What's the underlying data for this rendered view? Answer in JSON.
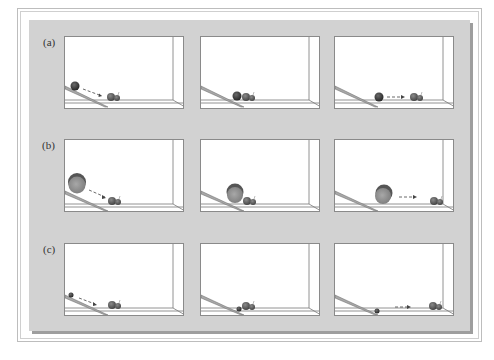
{
  "figure": {
    "rows": [
      {
        "label": "(a)",
        "ball": "medium-dark",
        "frames": [
          "ball rolling down ramp toward two balls",
          "collision at ramp base",
          "ball stopped, struck balls move right"
        ]
      },
      {
        "label": "(b)",
        "ball": "large-gray",
        "frames": [
          "large ball rolling down ramp toward two balls",
          "collision at ramp base",
          "large ball stopped, struck balls move right"
        ]
      },
      {
        "label": "(c)",
        "ball": "small-dark",
        "frames": [
          "small ball rolling down ramp toward two balls",
          "collision at ramp base",
          "small ball stopped, struck balls move right"
        ]
      }
    ]
  },
  "colors": {
    "plate": "#d2d2d2",
    "shadow": "#9e9e9e",
    "panel_bg": "#ffffff",
    "ball_dark": "#3a3a3a",
    "ball_gray": "#8c8c8c",
    "ramp": "#a8a8a8"
  }
}
